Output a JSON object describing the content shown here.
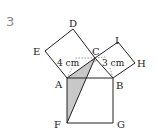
{
  "problem_number": "3",
  "labels": {
    "A": "A",
    "B": "B",
    "C": "C",
    "D": "D",
    "E": "E",
    "F": "F",
    "G": "G",
    "H": "H",
    "I": "I"
  },
  "dimensions": {
    "AC": "4 cm",
    "BC": "3 cm"
  },
  "colors": {
    "line": "#222222",
    "shade": "#c8c8c8",
    "number": "#888888"
  }
}
